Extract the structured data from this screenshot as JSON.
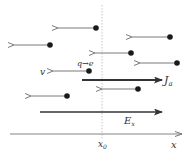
{
  "diagram": {
    "title": "",
    "colors": {
      "dot": "#1a1a1a",
      "thin_arrow": "#7a7a7a",
      "thick_arrow": "#333333",
      "axis": "#777777",
      "dashed": "#b8b8b8"
    },
    "labels": {
      "charge": "q→e",
      "velocity": "v",
      "current": "J",
      "current_sub": "a",
      "field": "E",
      "field_sub": "x",
      "axis": "x",
      "position": "x",
      "position_sub": "0"
    },
    "particles": [
      {
        "dot": [
          96,
          28
        ],
        "tip": [
          58,
          28
        ]
      },
      {
        "dot": [
          50,
          45
        ],
        "tip": [
          14,
          45
        ]
      },
      {
        "dot": [
          170,
          37
        ],
        "tip": [
          132,
          37
        ]
      },
      {
        "dot": [
          131,
          53
        ],
        "tip": [
          95,
          53
        ]
      },
      {
        "dot": [
          177,
          63
        ],
        "tip": [
          140,
          63
        ]
      },
      {
        "dot": [
          89,
          71
        ],
        "tip": [
          53,
          71
        ]
      },
      {
        "dot": [
          138,
          89
        ],
        "tip": [
          102,
          89
        ]
      },
      {
        "dot": [
          67,
          96
        ],
        "tip": [
          31,
          96
        ]
      }
    ],
    "current_arrow": {
      "from": [
        82,
        80
      ],
      "to": [
        162,
        80
      ]
    },
    "field_arrow": {
      "from": [
        40,
        112
      ],
      "to": [
        162,
        112
      ]
    },
    "x_axis": {
      "from": [
        10,
        134
      ],
      "to": [
        182,
        134
      ]
    },
    "x0_line": {
      "x": 102,
      "y1": 5,
      "y2": 138
    }
  }
}
